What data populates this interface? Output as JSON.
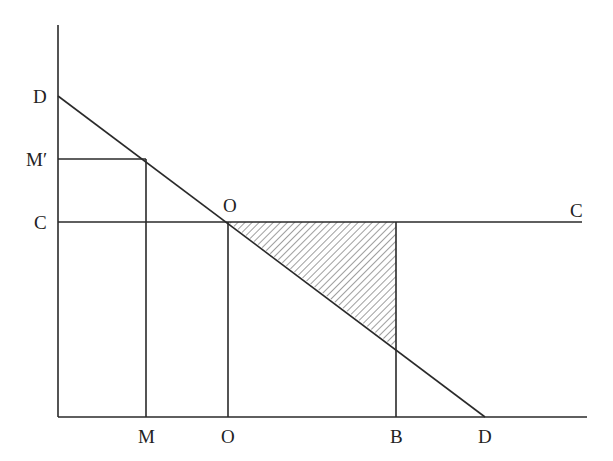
{
  "diagram": {
    "type": "economics-supply-demand",
    "y_axis_labels": {
      "D": "D",
      "M_prime": "M′",
      "C": "C"
    },
    "x_axis_labels": {
      "M": "M",
      "O": "O",
      "B": "B",
      "D": "D"
    },
    "point_labels": {
      "O_intersection": "O",
      "C_right": "C"
    },
    "lines": [
      {
        "name": "demand-curve",
        "from": "D (y-axis)",
        "to": "D (x-axis)"
      },
      {
        "name": "cost-line",
        "label": "C–C",
        "horizontal": true
      },
      {
        "name": "M-prime-horizontal",
        "from": "M′",
        "to": "demand-curve"
      },
      {
        "name": "M-vertical",
        "from": "M",
        "to": "demand-curve"
      },
      {
        "name": "O-vertical",
        "from": "O",
        "to": "intersection"
      },
      {
        "name": "B-vertical",
        "from": "B",
        "to": "cost-line"
      }
    ],
    "shaded_region": "triangle between C–C line, demand curve, and vertical at B (deadweight loss)",
    "colors": {
      "line": "#2a2a2a",
      "background": "#ffffff"
    }
  }
}
